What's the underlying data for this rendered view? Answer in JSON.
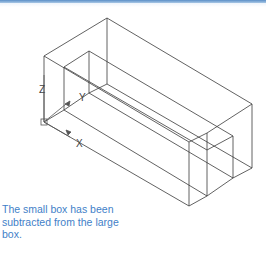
{
  "figure": {
    "caption": "The small box has been subtracted from the large box.",
    "accent_color": "#3f7fc8",
    "line_color": "#3a3a3a",
    "ucs_icon": {
      "axis_labels": {
        "x": "X",
        "y": "Y",
        "z": "Z"
      }
    }
  }
}
